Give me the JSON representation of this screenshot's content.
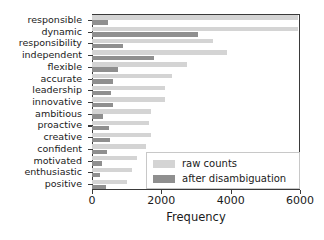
{
  "chart_data": {
    "type": "bar",
    "orientation": "horizontal",
    "title": "",
    "xlabel": "Frequency",
    "ylabel": "",
    "xlim": [
      0,
      6000
    ],
    "xticks": [
      0,
      2000,
      4000,
      6000
    ],
    "xtick_labels": [
      "0",
      "2000",
      "4000",
      "6000"
    ],
    "grid": false,
    "legend_position": "lower right",
    "categories": [
      "responsible",
      "dynamic",
      "responsibility",
      "independent",
      "flexible",
      "accurate",
      "leadership",
      "innovative",
      "ambitious",
      "proactive",
      "creative",
      "confident",
      "motivated",
      "enthusiastic",
      "positive"
    ],
    "series": [
      {
        "name": "raw counts",
        "color": "#d4d4d4",
        "values": [
          5950,
          5950,
          3500,
          3900,
          2750,
          2300,
          2100,
          2100,
          1700,
          1650,
          1700,
          1550,
          1300,
          1150,
          1000
        ]
      },
      {
        "name": "after disambiguation",
        "color": "#8f8f8f",
        "values": [
          450,
          3050,
          900,
          1800,
          750,
          620,
          560,
          620,
          330,
          480,
          520,
          420,
          280,
          230,
          400
        ]
      }
    ]
  },
  "legend": {
    "items": [
      {
        "label": "raw counts",
        "color": "#d4d4d4"
      },
      {
        "label": "after disambiguation",
        "color": "#8f8f8f"
      }
    ]
  },
  "axis": {
    "x_title": "Frequency"
  }
}
